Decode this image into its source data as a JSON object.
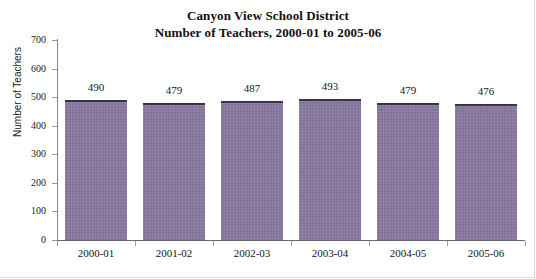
{
  "chart_data": {
    "type": "bar",
    "title": "Canyon View School District\nNumber of Teachers, 2000-01 to 2005-06",
    "title_lines": [
      "Canyon View School District",
      "Number of Teachers, 2000-01 to 2005-06"
    ],
    "xlabel": "",
    "ylabel": "Number of Teachers",
    "categories": [
      "2000-01",
      "2001-02",
      "2002-03",
      "2003-04",
      "2004-05",
      "2005-06"
    ],
    "values": [
      490,
      479,
      487,
      493,
      479,
      476
    ],
    "data_labels": [
      "490",
      "479",
      "487",
      "493",
      "479",
      "476"
    ],
    "ylim": [
      0,
      700
    ],
    "ytick_values": [
      0,
      100,
      200,
      300,
      400,
      500,
      600,
      700
    ],
    "ytick_labels": [
      "0",
      "100",
      "200",
      "300",
      "400",
      "500",
      "600",
      "700"
    ],
    "grid": false,
    "legend": false,
    "legend_position": "none",
    "series": [
      {
        "name": "Number of Teachers",
        "values": [
          490,
          479,
          487,
          493,
          479,
          476
        ],
        "color": "#8c7ca4",
        "edge_color": "#3b2f4d"
      }
    ]
  },
  "colors": {
    "bar_fill": "#8c7ca4",
    "bar_edge": "#3b2f4d",
    "axis": "#6a6a6a",
    "text": "#161616",
    "background": "#ffffff"
  }
}
